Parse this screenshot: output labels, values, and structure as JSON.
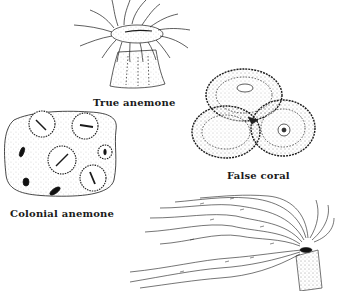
{
  "figure": {
    "type": "scientific-illustration",
    "specimens": [
      {
        "id": "true-anemone",
        "label": "True anemone"
      },
      {
        "id": "false-coral",
        "label": "False coral"
      },
      {
        "id": "colonial-anemone",
        "label": "Colonial anemone"
      },
      {
        "id": "tube-anemone",
        "label": ""
      }
    ],
    "colors": {
      "ink": "#1a1a1a",
      "background": "#ffffff"
    }
  }
}
